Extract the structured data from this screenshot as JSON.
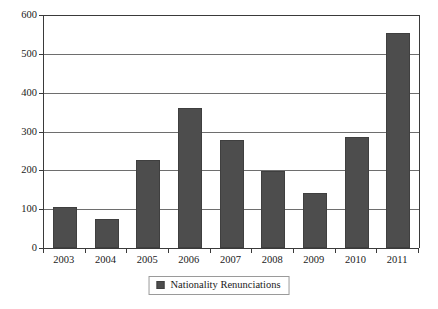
{
  "chart_data": {
    "type": "bar",
    "title": "",
    "subtitle": "",
    "xlabel": "",
    "ylabel": "",
    "categories": [
      "2003",
      "2004",
      "2005",
      "2006",
      "2007",
      "2008",
      "2009",
      "2010",
      "2011"
    ],
    "values": [
      105,
      75,
      227,
      360,
      278,
      198,
      142,
      287,
      553
    ],
    "series": [
      {
        "name": "Nationality Renunciations",
        "values": [
          105,
          75,
          227,
          360,
          278,
          198,
          142,
          287,
          553
        ],
        "color": "#4d4d4d"
      }
    ],
    "ylim": [
      0,
      600
    ],
    "yticks": [
      0,
      100,
      200,
      300,
      400,
      500,
      600
    ],
    "ytick_labels": [
      "0",
      "100",
      "200",
      "300",
      "400",
      "500",
      "600"
    ],
    "grid": true,
    "grid_axis": "y",
    "legend": {
      "position": "bottom-center",
      "entries": [
        {
          "label": "Nationality Renunciations",
          "color": "#4d4d4d",
          "marker": "square"
        }
      ]
    },
    "colors": {
      "bar_fill": "#4d4d4d",
      "bar_edge": "#3f3f3f",
      "gridline": "#6e6e6e",
      "axis": "#3a3a3a",
      "text": "#1a1a1a",
      "background": "#ffffff"
    }
  }
}
